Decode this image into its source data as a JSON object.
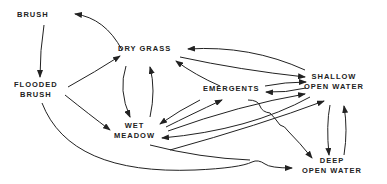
{
  "diagram": {
    "type": "state-transition",
    "nodes": {
      "brush": {
        "lines": [
          "BRUSH"
        ]
      },
      "flooded_brush": {
        "lines": [
          "FLOODED",
          "BRUSH"
        ]
      },
      "dry_grass": {
        "lines": [
          "DRY GRASS"
        ]
      },
      "emergents": {
        "lines": [
          "EMERGENTS"
        ]
      },
      "wet_meadow": {
        "lines": [
          "WET",
          "MEADOW"
        ]
      },
      "shallow_open_water": {
        "lines": [
          "SHALLOW",
          "OPEN WATER"
        ]
      },
      "deep_open_water": {
        "lines": [
          "DEEP",
          "OPEN WATER"
        ]
      }
    },
    "edges": [
      {
        "from": "BRUSH",
        "to": "FLOODED BRUSH"
      },
      {
        "from": "DRY GRASS",
        "to": "BRUSH"
      },
      {
        "from": "FLOODED BRUSH",
        "to": "DRY GRASS"
      },
      {
        "from": "FLOODED BRUSH",
        "to": "WET MEADOW"
      },
      {
        "from": "FLOODED BRUSH",
        "to": "DEEP OPEN WATER"
      },
      {
        "from": "DRY GRASS",
        "to": "WET MEADOW"
      },
      {
        "from": "WET MEADOW",
        "to": "DRY GRASS"
      },
      {
        "from": "SHALLOW OPEN WATER",
        "to": "DRY GRASS"
      },
      {
        "from": "DRY GRASS",
        "to": "SHALLOW OPEN WATER"
      },
      {
        "from": "EMERGENTS",
        "to": "DRY GRASS"
      },
      {
        "from": "EMERGENTS",
        "to": "WET MEADOW"
      },
      {
        "from": "WET MEADOW",
        "to": "EMERGENTS"
      },
      {
        "from": "EMERGENTS",
        "to": "SHALLOW OPEN WATER"
      },
      {
        "from": "SHALLOW OPEN WATER",
        "to": "EMERGENTS"
      },
      {
        "from": "WET MEADOW",
        "to": "SHALLOW OPEN WATER"
      },
      {
        "from": "SHALLOW OPEN WATER",
        "to": "WET MEADOW"
      },
      {
        "from": "WET MEADOW",
        "to": "DEEP OPEN WATER"
      },
      {
        "from": "EMERGENTS",
        "to": "DEEP OPEN WATER"
      },
      {
        "from": "SHALLOW OPEN WATER",
        "to": "DEEP OPEN WATER"
      },
      {
        "from": "DEEP OPEN WATER",
        "to": "SHALLOW OPEN WATER"
      }
    ]
  }
}
